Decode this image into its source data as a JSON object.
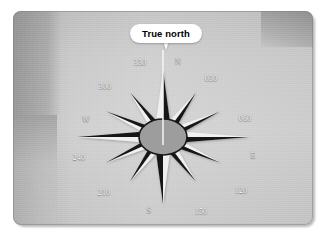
{
  "figure": {
    "type": "compass-rose-diagram",
    "background_color": "#c9c9c9",
    "panel_color": "#cfcfcf"
  },
  "callout": {
    "label": "True north",
    "text_color": "#000000",
    "bubble_color": "#ffffff"
  },
  "compass": {
    "center": {
      "x": 163,
      "y": 137
    },
    "hub": {
      "rx": 24,
      "ry": 18,
      "fill": "#9d9d9d",
      "stroke": "#1a1a1a"
    },
    "needle_color": "#f2f2f2",
    "point_dark_color": "#141414",
    "point_light_color": "#f0f0f0",
    "label_color": "#ffffff",
    "points": [
      {
        "label": "N",
        "bearing": 0,
        "type": "cardinal",
        "label_x": 178,
        "label_y": 61
      },
      {
        "label": "030",
        "bearing": 30,
        "type": "intercardinal",
        "label_x": 211,
        "label_y": 78
      },
      {
        "label": "060",
        "bearing": 60,
        "type": "intercardinal",
        "label_x": 245,
        "label_y": 118
      },
      {
        "label": "E",
        "bearing": 90,
        "type": "cardinal",
        "label_x": 253,
        "label_y": 155
      },
      {
        "label": "120",
        "bearing": 120,
        "type": "intercardinal",
        "label_x": 241,
        "label_y": 190
      },
      {
        "label": "150",
        "bearing": 150,
        "type": "intercardinal",
        "label_x": 201,
        "label_y": 211
      },
      {
        "label": "S",
        "bearing": 180,
        "type": "cardinal",
        "label_x": 149,
        "label_y": 210
      },
      {
        "label": "210",
        "bearing": 210,
        "type": "intercardinal",
        "label_x": 104,
        "label_y": 192
      },
      {
        "label": "240",
        "bearing": 240,
        "type": "intercardinal",
        "label_x": 79,
        "label_y": 157
      },
      {
        "label": "W",
        "bearing": 270,
        "type": "cardinal",
        "label_x": 86,
        "label_y": 119
      },
      {
        "label": "300",
        "bearing": 300,
        "type": "intercardinal",
        "label_x": 105,
        "label_y": 86
      },
      {
        "label": "330",
        "bearing": 330,
        "type": "intercardinal",
        "label_x": 140,
        "label_y": 62
      }
    ]
  }
}
